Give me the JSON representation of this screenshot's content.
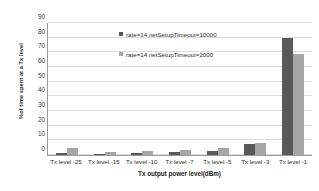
{
  "chart_data": {
    "type": "bar",
    "title": "",
    "xlabel": "Tx output power level(dBm)",
    "ylabel": "%of time spent at a Tx level",
    "categories": [
      "Tx level -25",
      "Tx level -15",
      "Tx level -10",
      "Tx level -7",
      "Tx level -5",
      "Tx level -3",
      "Tx level -1"
    ],
    "series": [
      {
        "name": "rate=14,netSetupTimeout=10000",
        "color": "#595959",
        "values": [
          1.5,
          0.8,
          1.5,
          1.8,
          3.0,
          7.5,
          80.0
        ]
      },
      {
        "name": "rate=14,netSetupTimeout=2000",
        "color": "#a6a6a6",
        "values": [
          4.5,
          2.0,
          2.5,
          3.5,
          5.0,
          8.0,
          69.0
        ]
      }
    ],
    "ylim": [
      0,
      90
    ],
    "yticks": [
      0,
      10,
      20,
      30,
      40,
      50,
      60,
      70,
      80,
      90
    ],
    "ytick_labels": [
      "0",
      "10",
      "20",
      "30",
      "40",
      "50",
      "60",
      "70",
      "80",
      "90"
    ],
    "grid": true,
    "legend_position": "upper-center-inside"
  }
}
